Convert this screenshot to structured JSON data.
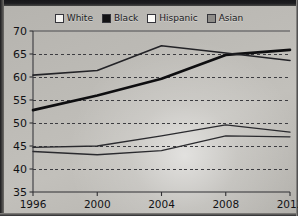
{
  "legend": {
    "position": "top-center",
    "items": [
      {
        "label": "White",
        "swatch": "#f3f2ef",
        "icon": "legend-swatch-white"
      },
      {
        "label": "Black",
        "swatch": "#121214",
        "icon": "legend-swatch-black"
      },
      {
        "label": "Hispanic",
        "swatch": "#fbfaf7",
        "icon": "legend-swatch-hispanic"
      },
      {
        "label": "Asian",
        "swatch": "#8e8c88",
        "icon": "legend-swatch-asian"
      }
    ]
  },
  "axes": {
    "y_ticks": [
      "35",
      "40",
      "45",
      "50",
      "55",
      "60",
      "65",
      "70"
    ],
    "x_ticks": [
      "1996",
      "2000",
      "2004",
      "2008",
      "2012"
    ]
  },
  "chart_data": {
    "type": "line",
    "title": "",
    "subtitle": "",
    "xlabel": "",
    "ylabel": "",
    "x": [
      1996,
      2000,
      2004,
      2008,
      2012
    ],
    "categories": [
      "1996",
      "2000",
      "2004",
      "2008",
      "2012"
    ],
    "xlim": [
      1996,
      2012
    ],
    "ylim": [
      35,
      70
    ],
    "y_tick_values": [
      35,
      40,
      45,
      50,
      55,
      60,
      65,
      70
    ],
    "grid": "horizontal-dashed",
    "legend_position": "top-center",
    "series": [
      {
        "name": "White",
        "values": [
          43.8,
          43.1,
          44.0,
          47.2,
          47.0
        ],
        "color": "#2a2a2e",
        "width": 1.3
      },
      {
        "name": "Black",
        "values": [
          52.8,
          56.0,
          59.6,
          64.8,
          65.9
        ],
        "color": "#0e0e10",
        "width": 2.6
      },
      {
        "name": "Hispanic",
        "values": [
          44.7,
          45.0,
          47.2,
          49.6,
          48.0
        ],
        "color": "#2a2a2e",
        "width": 1.3
      },
      {
        "name": "Asian",
        "values": [
          60.4,
          61.4,
          66.8,
          65.2,
          63.6
        ],
        "color": "#232327",
        "width": 1.6
      }
    ]
  }
}
